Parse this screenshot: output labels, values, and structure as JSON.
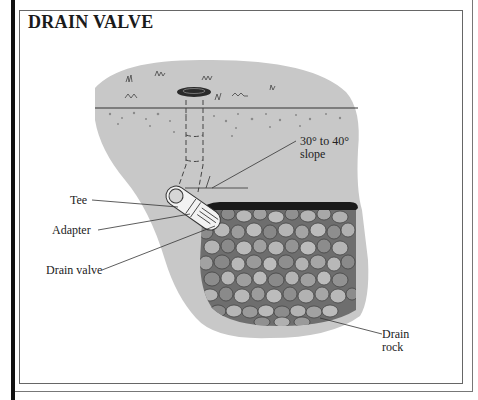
{
  "title": "DRAIN VALVE",
  "labels": {
    "slope": "30° to 40°",
    "slope_2": "slope",
    "tee": "Tee",
    "adapter": "Adapter",
    "drain_valve": "Drain valve",
    "drain_rock": "Drain",
    "drain_rock_2": "rock"
  },
  "colors": {
    "soil": "#c8c8c8",
    "rock_light": "#b4b4b4",
    "rock_dark": "#7a7a7a",
    "liner": "#1a1a1a",
    "text": "#222222"
  }
}
